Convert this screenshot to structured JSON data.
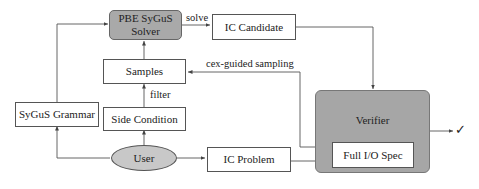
{
  "diagram": {
    "nodes": {
      "solver": {
        "line1": "PBE SyGuS",
        "line2": "Solver"
      },
      "ic_candidate": "IC Candidate",
      "samples": "Samples",
      "side_condition": "Side Condition",
      "sygus_grammar": "SyGuS Grammar",
      "user": "User",
      "ic_problem": "IC Problem",
      "verifier": "Verifier",
      "full_io_spec": "Full I/O Spec"
    },
    "edge_labels": {
      "solve": "solve",
      "cex_guided_sampling": "cex-guided sampling",
      "filter": "filter"
    },
    "output_symbol": "✓",
    "colors": {
      "solver_fill": "#a9a9a9",
      "verifier_fill": "#a6a6a6",
      "user_fill": "#c8c8c8",
      "stroke": "#555555"
    }
  }
}
